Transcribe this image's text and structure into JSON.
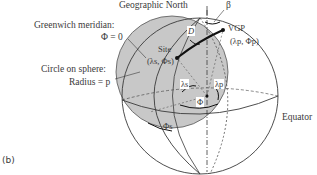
{
  "figure": {
    "panel_label": "(b)",
    "labels": {
      "geographic_north": "Geographic North",
      "beta": "β",
      "greenwich_meridian": "Greenwich meridian:",
      "phi_zero": "Φ = 0",
      "circle_on_sphere": "Circle on sphere:",
      "radius": "Radius = p",
      "site": "Site",
      "site_coords": "(λs, Φs)",
      "distance": "D",
      "vgp": "VGP",
      "vgp_coords": "(λp, Φp)",
      "lambda_s": "λs",
      "lambda_p": "λp",
      "phi": "Φ",
      "phi_s": "Φs",
      "equator": "Equator"
    },
    "colors": {
      "cap_fill": "#c8c8c8",
      "line": "#3a3a3a",
      "background": "#ffffff"
    }
  }
}
